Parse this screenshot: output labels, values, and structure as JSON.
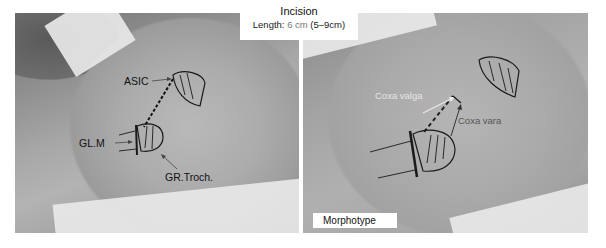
{
  "title": {
    "heading": "Incision",
    "length_label": "Length:",
    "length_value": "6 cm",
    "length_range": "(5–9cm)"
  },
  "left_panel": {
    "labels": {
      "asic": "ASIC",
      "glm": "GL.M",
      "gr_troch": "GR.Troch."
    }
  },
  "right_panel": {
    "labels": {
      "coxa_valga": "Coxa valga",
      "coxa_vara": "Coxa vara"
    },
    "caption": "Morphotype"
  },
  "colors": {
    "marker_ink": "#1a1a1a",
    "label_grey": "#555555",
    "label_light": "#e6e6e6",
    "box_bg": "#ffffff"
  }
}
